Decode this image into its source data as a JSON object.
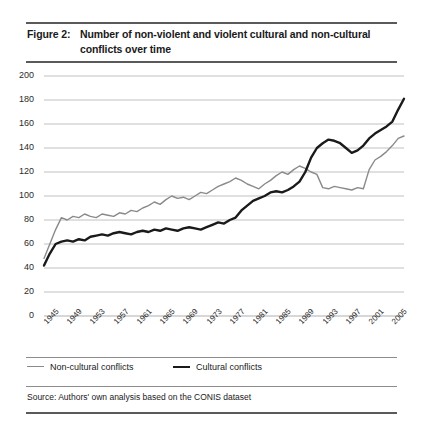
{
  "figure": {
    "number": "Figure 2:",
    "title": "Number of non-violent and violent cultural and non-cultural conflicts over time",
    "source": "Source: Authors' own analysis based on the CONIS dataset"
  },
  "legend": {
    "non_cultural_label": "Non-cultural conflicts",
    "cultural_label": "Cultural conflicts"
  },
  "colors": {
    "non_cultural": "#8a8a8a",
    "cultural": "#1a1a1a",
    "gridline": "#b0b0b0",
    "rule": "#5a5a5a"
  },
  "chart_data": {
    "type": "line",
    "title": "Number of non-violent and violent cultural and non-cultural conflicts over time",
    "xlabel": "",
    "ylabel": "",
    "xlim": [
      1945,
      2007
    ],
    "ylim": [
      0,
      200
    ],
    "grid": true,
    "legend_position": "below",
    "ytick_labels": [
      "0",
      "20",
      "40",
      "60",
      "80",
      "100",
      "120",
      "140",
      "160",
      "180",
      "200"
    ],
    "ytick_values": [
      0,
      20,
      40,
      60,
      80,
      100,
      120,
      140,
      160,
      180,
      200
    ],
    "xtick_labels": [
      "1945",
      "1949",
      "1953",
      "1957",
      "1961",
      "1965",
      "1969",
      "1973",
      "1977",
      "1981",
      "1985",
      "1989",
      "1993",
      "1997",
      "2001",
      "2005"
    ],
    "xtick_values": [
      1945,
      1949,
      1953,
      1957,
      1961,
      1965,
      1969,
      1973,
      1977,
      1981,
      1985,
      1989,
      1993,
      1997,
      2001,
      2005
    ],
    "x": [
      1945,
      1946,
      1947,
      1948,
      1949,
      1950,
      1951,
      1952,
      1953,
      1954,
      1955,
      1956,
      1957,
      1958,
      1959,
      1960,
      1961,
      1962,
      1963,
      1964,
      1965,
      1966,
      1967,
      1968,
      1969,
      1970,
      1971,
      1972,
      1973,
      1974,
      1975,
      1976,
      1977,
      1978,
      1979,
      1980,
      1981,
      1982,
      1983,
      1984,
      1985,
      1986,
      1987,
      1988,
      1989,
      1990,
      1991,
      1992,
      1993,
      1994,
      1995,
      1996,
      1997,
      1998,
      1999,
      2000,
      2001,
      2002,
      2003,
      2004,
      2005,
      2006,
      2007
    ],
    "series": [
      {
        "name": "Non-cultural conflicts",
        "color": "#8a8a8a",
        "width": 1.4,
        "values": [
          48,
          60,
          72,
          82,
          80,
          83,
          82,
          85,
          83,
          82,
          85,
          84,
          83,
          86,
          85,
          88,
          87,
          90,
          92,
          95,
          93,
          97,
          100,
          98,
          99,
          97,
          100,
          103,
          102,
          105,
          108,
          110,
          112,
          115,
          113,
          110,
          108,
          106,
          110,
          113,
          117,
          120,
          118,
          122,
          125,
          123,
          120,
          118,
          107,
          106,
          108,
          107,
          106,
          105,
          107,
          106,
          122,
          130,
          133,
          137,
          142,
          148,
          150
        ]
      },
      {
        "name": "Cultural conflicts",
        "color": "#1a1a1a",
        "width": 2.4,
        "values": [
          42,
          52,
          60,
          62,
          63,
          62,
          64,
          63,
          66,
          67,
          68,
          67,
          69,
          70,
          69,
          68,
          70,
          71,
          70,
          72,
          71,
          73,
          72,
          71,
          73,
          74,
          73,
          72,
          74,
          76,
          78,
          77,
          80,
          82,
          88,
          92,
          96,
          98,
          100,
          103,
          104,
          103,
          105,
          108,
          112,
          120,
          132,
          140,
          144,
          147,
          146,
          144,
          140,
          136,
          138,
          142,
          148,
          152,
          155,
          158,
          162,
          172,
          181
        ]
      }
    ]
  }
}
